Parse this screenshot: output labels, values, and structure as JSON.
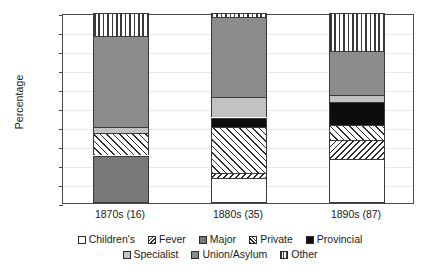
{
  "chart_data": {
    "type": "bar",
    "subtype": "stacked-bar-100-percent",
    "title": "",
    "xlabel": "",
    "ylabel": "Percentage",
    "ylim": [
      0,
      100
    ],
    "ytick_labels": [
      "100",
      "90",
      "80",
      "70",
      "60",
      "50",
      "40",
      "30",
      "20",
      "10",
      "0"
    ],
    "ytick_values": [
      100,
      90,
      80,
      70,
      60,
      50,
      40,
      30,
      20,
      10,
      0
    ],
    "ytick_interval": 10,
    "grid": true,
    "grid_axis": "y",
    "legend_position": "bottom",
    "categories": [
      "1870s (16)",
      "1880s (35)",
      "1890s (87)"
    ],
    "series": [
      {
        "name": "Children's",
        "fill": "white",
        "values": [
          0,
          13,
          23
        ]
      },
      {
        "name": "Fever",
        "fill": "backslash-hatch",
        "values": [
          0,
          3,
          10
        ]
      },
      {
        "name": "Major",
        "fill": "dark-gray",
        "values": [
          25,
          0,
          0
        ]
      },
      {
        "name": "Private",
        "fill": "forwardslash-hatch",
        "values": [
          12,
          24,
          8
        ]
      },
      {
        "name": "Provincial",
        "fill": "black",
        "values": [
          0,
          5,
          12
        ]
      },
      {
        "name": "Specialist",
        "fill": "light-gray",
        "values": [
          3,
          11,
          4
        ]
      },
      {
        "name": "Union/Asylum",
        "fill": "medium-gray",
        "values": [
          48,
          42,
          23
        ]
      },
      {
        "name": "Other",
        "fill": "vertical-lines",
        "values": [
          12,
          2,
          20
        ]
      }
    ],
    "stack_boundaries": {
      "1870s (16)": [
        {
          "name": "Major",
          "from": 0,
          "to": 25
        },
        {
          "name": "Private",
          "from": 25,
          "to": 37
        },
        {
          "name": "Specialist",
          "from": 37,
          "to": 40
        },
        {
          "name": "Union/Asylum",
          "from": 40,
          "to": 88
        },
        {
          "name": "Other",
          "from": 88,
          "to": 100
        }
      ],
      "1880s (35)": [
        {
          "name": "Children's",
          "from": 0,
          "to": 13
        },
        {
          "name": "Fever",
          "from": 13,
          "to": 16
        },
        {
          "name": "Private",
          "from": 16,
          "to": 40
        },
        {
          "name": "Provincial",
          "from": 40,
          "to": 45
        },
        {
          "name": "Specialist",
          "from": 45,
          "to": 56
        },
        {
          "name": "Union/Asylum",
          "from": 56,
          "to": 98
        },
        {
          "name": "Other",
          "from": 98,
          "to": 100
        }
      ],
      "1890s (87)": [
        {
          "name": "Children's",
          "from": 0,
          "to": 23
        },
        {
          "name": "Fever",
          "from": 23,
          "to": 33
        },
        {
          "name": "Private",
          "from": 33,
          "to": 41
        },
        {
          "name": "Provincial",
          "from": 41,
          "to": 53
        },
        {
          "name": "Specialist",
          "from": 53,
          "to": 57
        },
        {
          "name": "Union/Asylum",
          "from": 57,
          "to": 80
        },
        {
          "name": "Other",
          "from": 80,
          "to": 100
        }
      ]
    }
  },
  "axis": {
    "ylabel": "Percentage",
    "yticks": [
      "100",
      "90",
      "80",
      "70",
      "60",
      "50",
      "40",
      "30",
      "20",
      "10",
      "0"
    ],
    "xticks": [
      "1870s (16)",
      "1880s (35)",
      "1890s (87)"
    ]
  },
  "legend": {
    "row1": [
      {
        "label": "Children's",
        "swatch": "white-swatch"
      },
      {
        "label": "Fever",
        "swatch": "backslash-hatch-swatch"
      },
      {
        "label": "Major",
        "swatch": "dark-gray-swatch"
      },
      {
        "label": "Private",
        "swatch": "forwardslash-hatch-swatch"
      },
      {
        "label": "Provincial",
        "swatch": "black-swatch"
      }
    ],
    "row2": [
      {
        "label": "Specialist",
        "swatch": "light-gray-swatch"
      },
      {
        "label": "Union/Asylum",
        "swatch": "medium-gray-swatch"
      },
      {
        "label": "Other",
        "swatch": "vertical-lines-swatch"
      }
    ]
  },
  "colors": {
    "major": "#787878",
    "provincial": "#0d0d0d",
    "specialist": "#c2c2c2",
    "union_asylum": "#8c8c8c",
    "childrens": "#ffffff",
    "axis": "#4a4a4a",
    "grid": "#e9e9e9"
  }
}
